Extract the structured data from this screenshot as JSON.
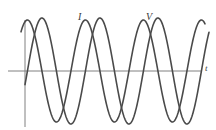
{
  "figure": {
    "name": "ac-voltage-current-phase-plot",
    "background_color": "#ffffff",
    "width": 216,
    "height": 130
  },
  "axes": {
    "origin_x": 25,
    "baseline_y": 71,
    "vertical_axis_top_y": 20,
    "vertical_axis_bottom_y": 127,
    "horizontal_axis_left_x": 8,
    "horizontal_axis_right_x": 202,
    "axis_color": "#808080",
    "axis_width": 1,
    "x_axis_label": "t",
    "y_axis_label": ""
  },
  "curves": [
    {
      "key": "current",
      "label": "I",
      "color": "#4a4a4a",
      "stroke_width": 1.6,
      "amplitude": 51,
      "period": 58,
      "phase_deg": 75,
      "label_x": 78,
      "label_y": 12
    },
    {
      "key": "voltage",
      "label": "V",
      "color": "#4a4a4a",
      "stroke_width": 1.6,
      "amplitude": 53,
      "period": 58,
      "phase_deg": -15,
      "label_x": 146,
      "label_y": 12
    }
  ],
  "chart_data": {
    "type": "line",
    "title": "",
    "xlabel": "t",
    "ylabel": "",
    "xlim": [
      8,
      210
    ],
    "ylim": [
      -55,
      55
    ],
    "grid": false,
    "legend": "inline-curve-labels",
    "annotations": [
      "I",
      "V",
      "t"
    ],
    "series": [
      {
        "name": "I",
        "description": "sinusoid leading in phase, first positive peak near x=40",
        "amplitude": 51,
        "period_px": 58,
        "phase_deg": 75,
        "peaks_x": [
          40,
          98,
          156
        ],
        "troughs_x": [
          69,
          127,
          185
        ],
        "zero_crossings_x": [
          25,
          54,
          83,
          112,
          141,
          170,
          199
        ]
      },
      {
        "name": "V",
        "description": "sinusoid lagging, rises from below axis at left, first positive peak near x=69",
        "amplitude": 53,
        "period_px": 58,
        "phase_deg": -15,
        "peaks_x": [
          69,
          127,
          185
        ],
        "troughs_x": [
          40,
          98,
          156
        ],
        "zero_crossings_x": [
          54,
          83,
          112,
          141,
          170,
          199
        ]
      }
    ]
  }
}
